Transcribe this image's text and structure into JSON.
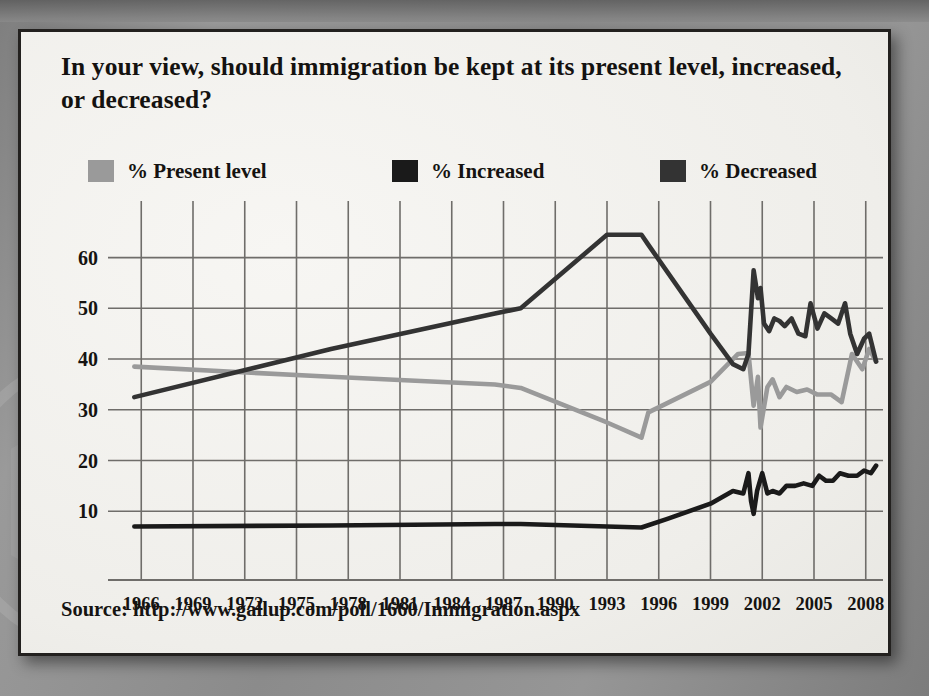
{
  "panel": {
    "title": "In your view, should immigration be kept at its present level, increased, or decreased?",
    "source": "Source: http://www.gallup.com/poll/1660/Immigration.aspx"
  },
  "legend": {
    "position": "top",
    "entries": [
      {
        "label": "% Present level",
        "color": "#9a9a9a"
      },
      {
        "label": "% Increased",
        "color": "#1a1a1a"
      },
      {
        "label": "% Decreased",
        "color": "#333333"
      }
    ]
  },
  "colors": {
    "present_level": "#9a9a9a",
    "increased": "#1a1a1a",
    "decreased": "#333333",
    "gridline": "#6f6d6a",
    "panel_background": "#f2f1ed",
    "panel_border": "#23211f",
    "page_background": "#8f8f8f",
    "text": "#151311"
  },
  "chart_data": {
    "type": "line",
    "title": "In your view, should immigration be kept at its present level, increased, or decreased?",
    "xlabel": "",
    "ylabel": "",
    "xlim": [
      1965,
      2009
    ],
    "ylim": [
      0,
      68
    ],
    "yticks": [
      10,
      20,
      30,
      40,
      50,
      60
    ],
    "xticks": [
      1966,
      1969,
      1972,
      1975,
      1978,
      1981,
      1984,
      1987,
      1990,
      1993,
      1996,
      1999,
      2002,
      2005,
      2008
    ],
    "grid": true,
    "legend_position": "top",
    "series": [
      {
        "name": "% Present level",
        "color": "#9a9a9a",
        "points": [
          [
            1965.6,
            38.5
          ],
          [
            1977.0,
            36.5
          ],
          [
            1986.5,
            35.0
          ],
          [
            1988.0,
            34.3
          ],
          [
            1993.0,
            27.5
          ],
          [
            1995.0,
            24.5
          ],
          [
            1995.4,
            29.5
          ],
          [
            1999.0,
            35.5
          ],
          [
            2000.6,
            41.0
          ],
          [
            2001.2,
            41.2
          ],
          [
            2001.5,
            30.8
          ],
          [
            2001.75,
            36.5
          ],
          [
            2001.9,
            26.5
          ],
          [
            2002.3,
            34.5
          ],
          [
            2002.6,
            36.0
          ],
          [
            2003.0,
            32.5
          ],
          [
            2003.4,
            34.5
          ],
          [
            2004.0,
            33.5
          ],
          [
            2004.6,
            34.0
          ],
          [
            2005.2,
            33.0
          ],
          [
            2006.0,
            33.0
          ],
          [
            2006.6,
            31.5
          ],
          [
            2007.2,
            41.0
          ],
          [
            2007.8,
            38.0
          ],
          [
            2008.2,
            42.0
          ],
          [
            2008.6,
            39.5
          ]
        ]
      },
      {
        "name": "% Decreased",
        "color": "#333333",
        "points": [
          [
            1965.6,
            32.5
          ],
          [
            1977.0,
            42.0
          ],
          [
            1986.5,
            49.0
          ],
          [
            1988.0,
            50.0
          ],
          [
            1993.0,
            64.5
          ],
          [
            1995.0,
            64.5
          ],
          [
            1995.4,
            62.5
          ],
          [
            1999.0,
            45.0
          ],
          [
            2000.3,
            39.0
          ],
          [
            2000.9,
            38.0
          ],
          [
            2001.2,
            41.0
          ],
          [
            2001.5,
            57.5
          ],
          [
            2001.75,
            52.0
          ],
          [
            2001.9,
            54.0
          ],
          [
            2002.1,
            47.0
          ],
          [
            2002.4,
            45.5
          ],
          [
            2002.7,
            48.0
          ],
          [
            2003.0,
            47.5
          ],
          [
            2003.3,
            46.5
          ],
          [
            2003.7,
            48.0
          ],
          [
            2004.1,
            45.0
          ],
          [
            2004.5,
            44.5
          ],
          [
            2004.8,
            51.0
          ],
          [
            2005.2,
            46.0
          ],
          [
            2005.6,
            49.0
          ],
          [
            2006.0,
            48.0
          ],
          [
            2006.4,
            47.0
          ],
          [
            2006.8,
            51.0
          ],
          [
            2007.1,
            45.0
          ],
          [
            2007.5,
            41.0
          ],
          [
            2007.9,
            44.0
          ],
          [
            2008.2,
            45.0
          ],
          [
            2008.6,
            39.5
          ]
        ]
      },
      {
        "name": "% Increased",
        "color": "#1a1a1a",
        "points": [
          [
            1965.6,
            7.0
          ],
          [
            1977.0,
            7.2
          ],
          [
            1986.5,
            7.5
          ],
          [
            1988.0,
            7.5
          ],
          [
            1993.0,
            7.0
          ],
          [
            1995.0,
            6.8
          ],
          [
            1996.5,
            8.5
          ],
          [
            1999.0,
            11.5
          ],
          [
            2000.3,
            14.0
          ],
          [
            2000.9,
            13.5
          ],
          [
            2001.2,
            17.5
          ],
          [
            2001.35,
            12.0
          ],
          [
            2001.5,
            9.5
          ],
          [
            2001.7,
            14.0
          ],
          [
            2002.0,
            17.5
          ],
          [
            2002.3,
            13.5
          ],
          [
            2002.6,
            14.0
          ],
          [
            2003.0,
            13.5
          ],
          [
            2003.4,
            15.0
          ],
          [
            2003.9,
            15.0
          ],
          [
            2004.4,
            15.5
          ],
          [
            2004.9,
            15.0
          ],
          [
            2005.3,
            17.0
          ],
          [
            2005.7,
            16.0
          ],
          [
            2006.1,
            16.0
          ],
          [
            2006.5,
            17.5
          ],
          [
            2007.0,
            17.0
          ],
          [
            2007.5,
            17.0
          ],
          [
            2007.9,
            18.0
          ],
          [
            2008.3,
            17.5
          ],
          [
            2008.6,
            19.0
          ]
        ]
      }
    ]
  }
}
